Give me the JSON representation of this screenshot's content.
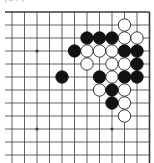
{
  "diagram": {
    "label": "(67)",
    "board": {
      "grid": {
        "columns": 12,
        "rows": 12,
        "x0": 12,
        "y0": 12,
        "dx": 12.5,
        "dy": 13,
        "left_stub_x": 5,
        "bottom_y": 163,
        "edges": [
          "top",
          "right"
        ]
      },
      "colors": {
        "line": "#3a3a3a",
        "black_stone": "#111111",
        "white_stone": "#ffffff",
        "white_stroke": "#222222"
      },
      "stone_radius": 6.2,
      "star_points": [
        {
          "col": 2,
          "row": 3
        },
        {
          "col": 2,
          "row": 9
        },
        {
          "col": 8,
          "row": 9
        }
      ],
      "stones": [
        {
          "color": "white",
          "col": 9,
          "row": 1
        },
        {
          "color": "black",
          "col": 6,
          "row": 2
        },
        {
          "color": "black",
          "col": 7,
          "row": 2
        },
        {
          "color": "black",
          "col": 8,
          "row": 2
        },
        {
          "color": "white",
          "col": 9,
          "row": 2
        },
        {
          "color": "white",
          "col": 10,
          "row": 2
        },
        {
          "color": "black",
          "col": 5,
          "row": 3
        },
        {
          "color": "white",
          "col": 6,
          "row": 3
        },
        {
          "color": "white",
          "col": 7,
          "row": 3
        },
        {
          "color": "white",
          "col": 8,
          "row": 3
        },
        {
          "color": "black",
          "col": 9,
          "row": 3
        },
        {
          "color": "black",
          "col": 10,
          "row": 3
        },
        {
          "color": "white",
          "col": 6,
          "row": 4
        },
        {
          "color": "white",
          "col": 8,
          "row": 4
        },
        {
          "color": "white",
          "col": 9,
          "row": 4
        },
        {
          "color": "black",
          "col": 10,
          "row": 4
        },
        {
          "color": "black",
          "col": 4,
          "row": 5
        },
        {
          "color": "black",
          "col": 7,
          "row": 5
        },
        {
          "color": "white",
          "col": 8,
          "row": 5
        },
        {
          "color": "black",
          "col": 9,
          "row": 5
        },
        {
          "color": "black",
          "col": 10,
          "row": 5
        },
        {
          "color": "white",
          "col": 7,
          "row": 6
        },
        {
          "color": "black",
          "col": 8,
          "row": 6
        },
        {
          "color": "white",
          "col": 9,
          "row": 6
        },
        {
          "color": "black",
          "col": 8,
          "row": 7
        },
        {
          "color": "white",
          "col": 9,
          "row": 7
        },
        {
          "color": "white",
          "col": 9,
          "row": 8
        }
      ]
    }
  }
}
